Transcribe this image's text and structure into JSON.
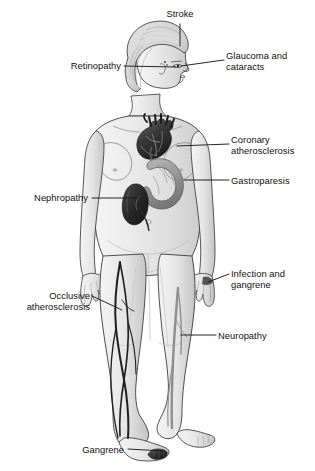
{
  "figure": {
    "background_color": "#ffffff",
    "body_fill_color": "#e9e9e9",
    "outline_color": "#2b2b2b",
    "organ_dark_color": "#2a2a2a",
    "organ_mid_color": "#8f8f8f",
    "organ_light_color": "#c8c8c8",
    "leader_line_color": "#1a1a1a",
    "label_text_color": "#111111"
  },
  "labels": [
    {
      "id": "stroke",
      "text": "Stroke",
      "side": "center",
      "target": "brain",
      "x": 150,
      "y": 8,
      "width": 60,
      "leader": {
        "x1": 180,
        "y1": 24,
        "x2": 180,
        "y2": 46
      }
    },
    {
      "id": "glaucoma-cataracts",
      "text": "Glaucoma and\ncataracts",
      "side": "right",
      "target": "eye",
      "x": 226,
      "y": 50,
      "width": 88,
      "leader": {
        "x1": 224,
        "y1": 60,
        "x2": 181,
        "y2": 66
      }
    },
    {
      "id": "retinopathy",
      "text": "Retinopathy",
      "side": "left",
      "target": "retina",
      "x": 53,
      "y": 60,
      "width": 68,
      "leader": {
        "x1": 124,
        "y1": 66,
        "x2": 176,
        "y2": 67
      }
    },
    {
      "id": "coronary-atherosclerosis",
      "text": "Coronary\natherosclerosis",
      "side": "right",
      "target": "heart",
      "x": 231,
      "y": 134,
      "width": 84,
      "leader": {
        "x1": 229,
        "y1": 144,
        "x2": 177,
        "y2": 146
      }
    },
    {
      "id": "gastroparesis",
      "text": "Gastroparesis",
      "side": "right",
      "target": "stomach",
      "x": 231,
      "y": 175,
      "width": 84,
      "leader": {
        "x1": 229,
        "y1": 180,
        "x2": 184,
        "y2": 180
      }
    },
    {
      "id": "nephropathy",
      "text": "Nephropathy",
      "side": "left",
      "target": "kidney",
      "x": 12,
      "y": 192,
      "width": 76,
      "leader": {
        "x1": 92,
        "y1": 198,
        "x2": 138,
        "y2": 198
      }
    },
    {
      "id": "infection-gangrene",
      "text": "Infection and\ngangrene",
      "side": "right",
      "target": "hand",
      "x": 231,
      "y": 268,
      "width": 84,
      "leader": {
        "x1": 229,
        "y1": 274,
        "x2": 208,
        "y2": 282
      }
    },
    {
      "id": "occlusive-atherosclerosis",
      "text": "Occlusive\natherosclerosis",
      "side": "left",
      "target": "leg-artery",
      "x": 6,
      "y": 290,
      "width": 84,
      "leader": {
        "x1": 92,
        "y1": 296,
        "x2": 122,
        "y2": 310
      }
    },
    {
      "id": "neuropathy",
      "text": "Neuropathy",
      "side": "right",
      "target": "leg-nerve",
      "x": 218,
      "y": 330,
      "width": 82,
      "leader": {
        "x1": 216,
        "y1": 335,
        "x2": 181,
        "y2": 335
      }
    },
    {
      "id": "gangrene",
      "text": "Gangrene",
      "side": "left",
      "target": "foot-toes",
      "x": 62,
      "y": 444,
      "width": 62,
      "leader": {
        "x1": 128,
        "y1": 449,
        "x2": 163,
        "y2": 451
      }
    }
  ],
  "anatomy": [
    {
      "id": "brain",
      "name": "brain",
      "shade": "light"
    },
    {
      "id": "eye",
      "name": "eye",
      "shade": "outline"
    },
    {
      "id": "heart",
      "name": "heart",
      "shade": "dark"
    },
    {
      "id": "stomach",
      "name": "stomach",
      "shade": "mid"
    },
    {
      "id": "kidney",
      "name": "kidney",
      "shade": "dark"
    },
    {
      "id": "arteries",
      "name": "leg arteries",
      "shade": "dark"
    },
    {
      "id": "nerves",
      "name": "leg nerves",
      "shade": "mid"
    },
    {
      "id": "gangrenous-toes",
      "name": "gangrenous toes",
      "shade": "dark"
    }
  ]
}
